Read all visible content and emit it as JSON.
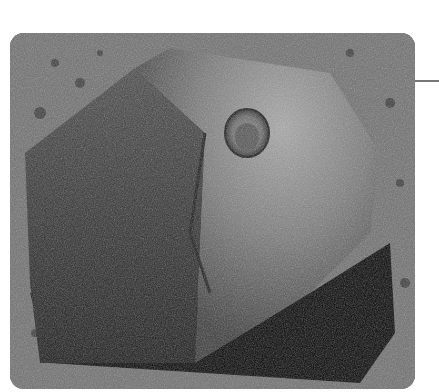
{
  "photo": {
    "subject": "rock with circular abrasion hole on gravelly ground",
    "background_color": "#ffffff",
    "ground_color": "#6f6f6f",
    "rock_color": "#5a5a5a",
    "shadow_color": "#050505"
  },
  "leader_line": {
    "color": "#777777"
  }
}
